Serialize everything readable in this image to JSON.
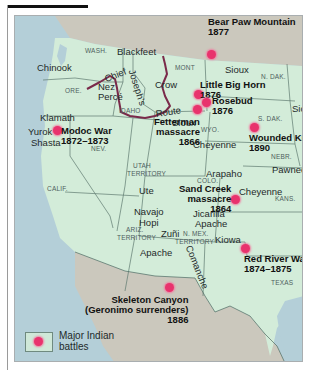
{
  "map": {
    "colors": {
      "land_us": "#d3ecd9",
      "land_other": "#cbc8bd",
      "water": "#b4cfd8",
      "battle_dot": "#e8336d",
      "route": "#7a2a4a"
    },
    "states": {
      "wash": "WASH.",
      "ore": "ORE.",
      "idaho": "IDAHO",
      "mont": "MONT",
      "n_dak": "N. DAK.",
      "s_dak": "S. DAK.",
      "wyo": "WYO.",
      "nebr": "NEBR.",
      "nev": "NEV.",
      "calif": "CALIF.",
      "utah1": "UTAH",
      "utah2": "TERRITORY",
      "colo": "COLO.",
      "kans": "KANS.",
      "ariz1": "ARIZ.",
      "ariz2": "TERRITORY",
      "nmex1": "N. MEX.",
      "nmex2": "TERRITORY",
      "texas": "TEXAS"
    },
    "tribes": {
      "chinook": "Chinook",
      "blackfeet": "Blackfeet",
      "nez_perce_1": "Nez",
      "nez_perce_2": "Percé",
      "crow": "Crow",
      "sioux_mont": "Sioux",
      "sioux_wyo": "Sioux",
      "sioux_sdak": "Sioux",
      "klamath": "Klamath",
      "yurok": "Yurok",
      "shasta": "Shasta",
      "cheyenne_wyo": "Cheyenne",
      "arapaho": "Arapaho",
      "pawnee": "Pawnee",
      "cheyenne_kans": "Cheyenne",
      "ute": "Ute",
      "navajo": "Navajo",
      "hopi": "Hopi",
      "jicarilla_1": "Jicarilla",
      "jicarilla_2": "Apache",
      "zuni": "Zuñi",
      "apache": "Apache",
      "kiowa": "Kiowa",
      "comanche": "Comanche"
    },
    "route": {
      "word1": "Chief",
      "word2": "Joseph's",
      "word3": "Route"
    },
    "battles": {
      "bear_paw": {
        "name": "Bear Paw Mountain",
        "year": "1877"
      },
      "little_big_horn": {
        "name": "Little Big Horn",
        "year": "1876"
      },
      "rosebud": {
        "name": "Rosebud",
        "year": "1876"
      },
      "fetterman": {
        "name1": "Fetterman",
        "name2": "massacre",
        "year": "1866"
      },
      "modoc": {
        "name": "Modoc War",
        "year": "1872–1873"
      },
      "wounded_knee": {
        "name": "Wounded Knee",
        "year": "1890"
      },
      "sand_creek": {
        "name1": "Sand Creek",
        "name2": "massacre",
        "year": "1864"
      },
      "red_river": {
        "name": "Red River War",
        "year": "1874–1875"
      },
      "skeleton_canyon": {
        "name1": "Skeleton Canyon",
        "name2": "(Geronimo surrenders)",
        "year": "1886"
      }
    },
    "legend": {
      "line1": "Major Indian",
      "line2": "battles"
    }
  }
}
